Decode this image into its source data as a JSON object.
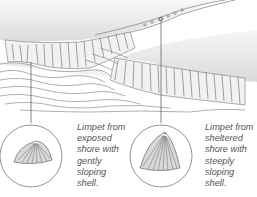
{
  "illustration": {
    "subject": "Coastal shore with cliffs and two limpet shells",
    "colors": {
      "background": "#ffffff",
      "ink": "#6b6b6b",
      "shading": "#cfcfcf",
      "text": "#555555"
    }
  },
  "callouts": [
    {
      "id": "exposed",
      "caption_lines": [
        "Limpet from",
        "exposed",
        "shore with",
        "gently",
        "sloping",
        "shell."
      ]
    },
    {
      "id": "sheltered",
      "caption_lines": [
        "Limpet from",
        "sheltered",
        "shore with",
        "steeply",
        "sloping",
        "shell."
      ]
    }
  ]
}
